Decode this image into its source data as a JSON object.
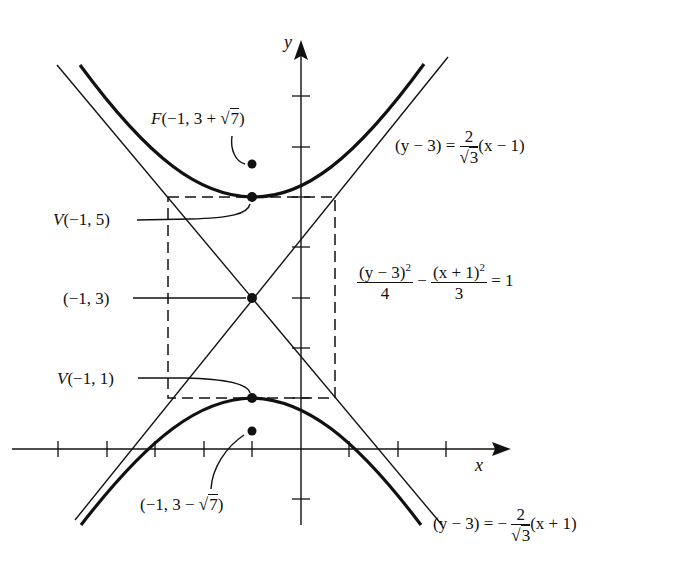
{
  "diagram": {
    "type": "hyperbola-graph",
    "axes": {
      "x_label": "x",
      "y_label": "y",
      "x_ticks": [
        -5,
        -4,
        -3,
        -2,
        -1,
        1,
        2,
        3
      ],
      "y_ticks": [
        -1,
        1,
        2,
        3,
        4,
        5,
        6,
        7
      ]
    },
    "hyperbola": {
      "equation_lhs_num1": "(y − 3)",
      "equation_lhs_den1": "4",
      "equation_minus": "−",
      "equation_lhs_num2": "(x + 1)",
      "equation_lhs_den2": "3",
      "equation_rhs": "= 1",
      "center": [
        -1,
        3
      ],
      "a": 2,
      "b_squared": 3
    },
    "points": {
      "focus_upper": {
        "label_prefix": "F",
        "label": "(−1, 3 + ",
        "sqrt": "7",
        "close": ")"
      },
      "vertex_upper": {
        "label_prefix": "V",
        "label": "(−1, 5)"
      },
      "center": {
        "label": "(−1, 3)"
      },
      "vertex_lower": {
        "label_prefix": "V",
        "label": "(−1, 1)"
      },
      "focus_lower": {
        "label": "(−1, 3 − ",
        "sqrt": "7",
        "close": ")"
      }
    },
    "asymptotes": {
      "upper": {
        "lhs": "(y − 3) =",
        "num": "2",
        "den": "3",
        "rhs": "(x − 1)"
      },
      "lower": {
        "lhs": "(y − 3) = −",
        "num": "2",
        "den": "3",
        "rhs": "(x + 1)"
      }
    }
  }
}
